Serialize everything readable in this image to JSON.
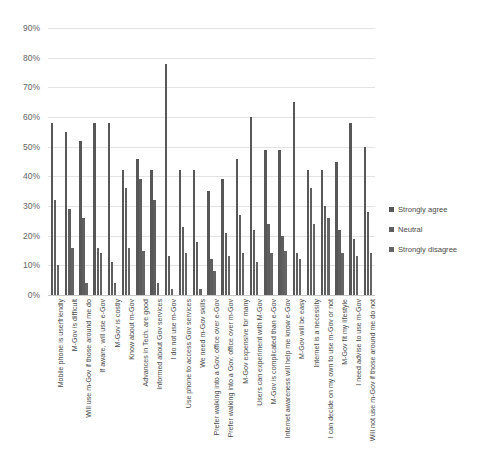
{
  "chart_data": {
    "type": "bar",
    "title": "",
    "subtitle": "",
    "xlabel": "",
    "ylabel": "",
    "ylim": [
      0,
      0.9
    ],
    "grid": true,
    "legend_position": "right",
    "ytick_labels": [
      "90%",
      "80%",
      "70%",
      "60%",
      "50%",
      "40%",
      "30%",
      "20%",
      "10%",
      "0%"
    ],
    "ytick_values": [
      90,
      80,
      70,
      60,
      50,
      40,
      30,
      20,
      10,
      0
    ],
    "categories": [
      "Mobile phone is userfriendly",
      "M-Gov is difficult",
      "Will use m-Gov if those around me do",
      "If aware, will use e-Gov",
      "M-Gov is costly",
      "Know about m-Gov",
      "Advances in Tech. are good",
      "Informed about Gov services",
      "I do not use m-Gov",
      "Use phone to access Gov services",
      "We need m-Gov skills",
      "Prefer walking into a Gov. office over e-Gov",
      "Prefer walking into a Gov. office over m-Gov",
      "M-Gov expensive for many",
      "Users can experiment with M-Gov",
      "M-Gov is complicated than e-Gov",
      "Internet awareness will help me know e-Gov",
      "M-Gov will be easy",
      "Internet is a necessity",
      "I can decide on my own to use m-Gov or not",
      "M-Gov fit my lifestyle",
      "I need advise to use m-Gov",
      "Will not use m-Gov if those around me do not"
    ],
    "series": [
      {
        "name": "Strongly agree",
        "color": "#575757",
        "values": [
          58,
          55,
          52,
          58,
          58,
          42,
          46,
          42,
          78,
          42,
          42,
          35,
          39,
          46,
          60,
          49,
          49,
          65,
          42,
          42,
          45,
          58,
          50
        ]
      },
      {
        "name": "Neutral",
        "color": "#5e5e5e",
        "values": [
          32,
          29,
          26,
          16,
          11,
          36,
          39,
          32,
          13,
          23,
          18,
          12,
          21,
          27,
          22,
          24,
          20,
          14,
          36,
          30,
          22,
          19,
          28
        ]
      },
      {
        "name": "Strongly disagree",
        "color": "#646464",
        "values": [
          10,
          16,
          4,
          14,
          4,
          16,
          15,
          4,
          2,
          14,
          2,
          8,
          13,
          14,
          11,
          14,
          15,
          12,
          24,
          26,
          14,
          13,
          14
        ]
      }
    ]
  },
  "legend": {
    "entries": [
      {
        "label": "Strongly agree"
      },
      {
        "label": "Neutral"
      },
      {
        "label": "Strongly disagree"
      }
    ]
  }
}
